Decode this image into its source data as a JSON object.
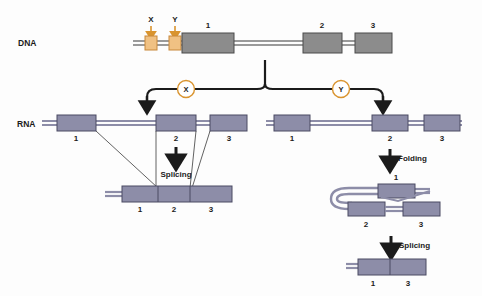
{
  "figure": {
    "colors": {
      "dna_exon_fill": "#8c8c8c",
      "dna_exon_stroke": "#4a4a4a",
      "dna_line": "#9a9a9a",
      "mutation_fill": "#f0c183",
      "mutation_stroke": "#c8883a",
      "arrow_orange": "#d9942f",
      "rna_fill": "#8d8da8",
      "rna_stroke": "#4a4a63",
      "rna_line": "#8d8da8",
      "bracket": "#1b1b1b",
      "text": "#1b1b1b",
      "circle_stroke": "#d9942f",
      "circle_fill": "#ffffff",
      "thin_line": "#3a3a3a"
    },
    "labels": {
      "dna": "DNA",
      "rna": "RNA",
      "splicing": "Splicing",
      "folding": "Folding",
      "mutation_x": "X",
      "mutation_y": "Y",
      "branch_x": "X",
      "branch_y": "Y"
    },
    "dna_strand": {
      "label": "DNA",
      "exons": [
        {
          "number": "1",
          "x": 182,
          "width": 52
        },
        {
          "number": "2",
          "x": 303,
          "width": 39
        },
        {
          "number": "3",
          "x": 355,
          "width": 37
        }
      ],
      "mutations": [
        {
          "name": "X",
          "x": 145,
          "width": 12
        },
        {
          "name": "Y",
          "x": 169,
          "width": 12
        }
      ]
    },
    "branch": {
      "left_path_label": "X",
      "right_path_label": "Y"
    },
    "left_pathway": {
      "rna_label": "RNA",
      "transcript_exons": [
        {
          "number": "1",
          "x": 57,
          "width": 39
        },
        {
          "number": "2",
          "x": 156,
          "width": 40
        },
        {
          "number": "3",
          "x": 210,
          "width": 37
        }
      ],
      "process": "Splicing",
      "product_segments": [
        {
          "number": "1",
          "x": 122,
          "width": 36
        },
        {
          "number": "2",
          "x": 158,
          "width": 32
        },
        {
          "number": "3",
          "x": 190,
          "width": 42
        }
      ]
    },
    "right_pathway": {
      "transcript_exons": [
        {
          "number": "1",
          "x": 274,
          "width": 36
        },
        {
          "number": "2",
          "x": 372,
          "width": 36
        },
        {
          "number": "3",
          "x": 424,
          "width": 36
        }
      ],
      "process_1": "Folding",
      "folded_exons": [
        {
          "number": "1",
          "x": 378,
          "width": 37
        },
        {
          "number": "2",
          "x": 348,
          "width": 37
        },
        {
          "number": "3",
          "x": 403,
          "width": 37
        }
      ],
      "process_2": "Splicing",
      "product_segments": [
        {
          "number": "1",
          "x": 358,
          "width": 32
        },
        {
          "number": "3",
          "x": 390,
          "width": 36
        }
      ]
    }
  }
}
